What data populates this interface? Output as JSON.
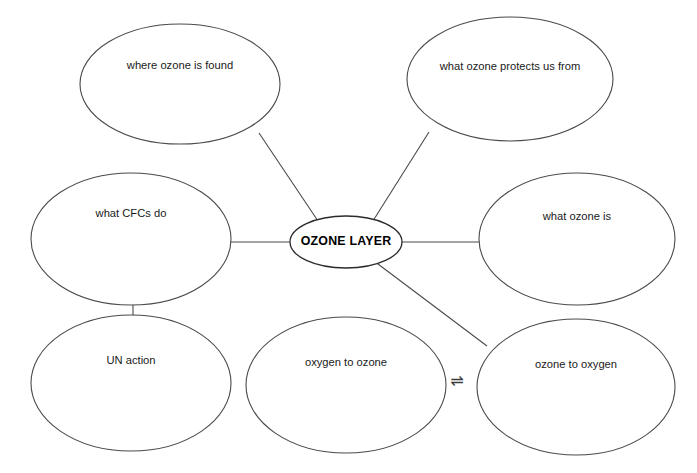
{
  "diagram": {
    "background_color": "#ffffff",
    "stroke_color": "#4a4a4a",
    "text_color": "#1a1a1a",
    "central_node": {
      "id": "ozone-layer",
      "label": "OZONE LAYER",
      "cx": 346,
      "cy": 242,
      "rx": 56,
      "ry": 26,
      "label_dy": 0,
      "bold": true
    },
    "nodes": [
      {
        "id": "where-ozone-is-found",
        "label": "where ozone is found",
        "cx": 180,
        "cy": 84,
        "rx": 100,
        "ry": 60,
        "label_dy": -18
      },
      {
        "id": "what-ozone-protects-us-from",
        "label": "what ozone protects us from",
        "cx": 510,
        "cy": 79,
        "rx": 103,
        "ry": 62,
        "label_dy": -12
      },
      {
        "id": "what-cfcs-do",
        "label": "what CFCs do",
        "cx": 131,
        "cy": 239,
        "rx": 100,
        "ry": 66,
        "label_dy": -25
      },
      {
        "id": "what-ozone-is",
        "label": "what ozone is",
        "cx": 577,
        "cy": 239,
        "rx": 98,
        "ry": 66,
        "label_dy": -22
      },
      {
        "id": "un-action",
        "label": "UN action",
        "cx": 131,
        "cy": 383,
        "rx": 100,
        "ry": 68,
        "label_dy": -22
      },
      {
        "id": "oxygen-to-ozone",
        "label": "oxygen to ozone",
        "cx": 346,
        "cy": 385,
        "rx": 100,
        "ry": 68,
        "label_dy": -22
      },
      {
        "id": "ozone-to-oxygen",
        "label": "ozone to oxygen",
        "cx": 576,
        "cy": 387,
        "rx": 99,
        "ry": 68,
        "label_dy": -22
      }
    ],
    "connectors": [
      {
        "id": "center-to-where-ozone-is-found",
        "x1": 320,
        "y1": 224,
        "x2": 259,
        "y2": 133
      },
      {
        "id": "center-to-what-ozone-protects-us-from",
        "x1": 371,
        "y1": 224,
        "x2": 429,
        "y2": 132
      },
      {
        "id": "center-to-what-cfcs-do",
        "x1": 290,
        "y1": 242,
        "x2": 231,
        "y2": 242
      },
      {
        "id": "center-to-what-ozone-is",
        "x1": 402,
        "y1": 242,
        "x2": 479,
        "y2": 242
      },
      {
        "id": "center-to-ozone-to-oxygen",
        "x1": 374,
        "y1": 261,
        "x2": 487,
        "y2": 346
      },
      {
        "id": "what-cfcs-do-to-un-action",
        "x1": 133,
        "y1": 303,
        "x2": 133,
        "y2": 317
      }
    ],
    "annotations": [
      {
        "id": "equilibrium-arrow",
        "symbol": "⇌",
        "meaning": "reversible reaction between oxygen to ozone and ozone to oxygen",
        "x": 457,
        "y": 381
      }
    ]
  }
}
